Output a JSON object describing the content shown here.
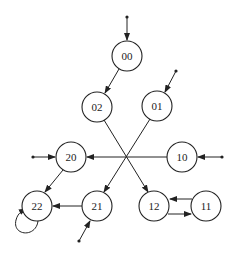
{
  "diagram": {
    "type": "state-transition-graph",
    "nodes": [
      {
        "id": "00",
        "label": "00",
        "x": 127,
        "y": 56
      },
      {
        "id": "02",
        "label": "02",
        "x": 97,
        "y": 107
      },
      {
        "id": "01",
        "label": "01",
        "x": 157,
        "y": 106
      },
      {
        "id": "20",
        "label": "20",
        "x": 71,
        "y": 157
      },
      {
        "id": "10",
        "label": "10",
        "x": 182,
        "y": 157
      },
      {
        "id": "22",
        "label": "22",
        "x": 37,
        "y": 206
      },
      {
        "id": "21",
        "label": "21",
        "x": 97,
        "y": 206
      },
      {
        "id": "12",
        "label": "12",
        "x": 154,
        "y": 206
      },
      {
        "id": "11",
        "label": "11",
        "x": 206,
        "y": 206
      }
    ],
    "edges": [
      {
        "from": "input",
        "to": "00"
      },
      {
        "from": "00",
        "to": "02"
      },
      {
        "from": "input",
        "to": "01"
      },
      {
        "from": "02",
        "to": "12"
      },
      {
        "from": "01",
        "to": "21"
      },
      {
        "from": "10",
        "to": "20"
      },
      {
        "from": "input",
        "to": "20"
      },
      {
        "from": "input",
        "to": "10"
      },
      {
        "from": "20",
        "to": "22"
      },
      {
        "from": "21",
        "to": "22"
      },
      {
        "from": "22",
        "to": "22"
      },
      {
        "from": "input",
        "to": "21"
      },
      {
        "from": "11",
        "to": "12"
      },
      {
        "from": "12",
        "to": "11"
      }
    ]
  }
}
